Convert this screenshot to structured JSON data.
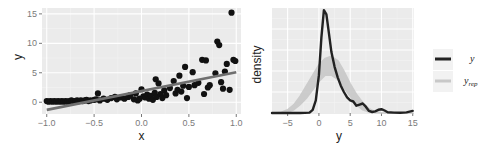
{
  "colors": {
    "panel_bg": "#ebebeb",
    "grid_major": "#ffffff",
    "grid_minor": "#f4f4f4",
    "points": "#111111",
    "fit_line": "#6f6f6f",
    "y_density": "#222222",
    "yrep_band": "#c8c8c8",
    "legend_key_bg": "#f2f2f2"
  },
  "chart_data": [
    {
      "type": "scatter",
      "title": "",
      "xlabel": "x",
      "ylabel": "y",
      "xlim": [
        -1.05,
        1.05
      ],
      "ylim": [
        -2,
        16
      ],
      "xticks": [
        -1.0,
        -0.5,
        0.0,
        0.5,
        1.0
      ],
      "xtick_labels": [
        "-1.0",
        "-0.5",
        "0.0",
        "0.5",
        "1.0"
      ],
      "yticks": [
        0,
        5,
        10,
        15
      ],
      "ytick_labels": [
        "0",
        "5",
        "10",
        "15"
      ],
      "grid": true,
      "points": [
        [
          -1.0,
          0.2
        ],
        [
          -0.98,
          0.1
        ],
        [
          -0.96,
          0.2
        ],
        [
          -0.94,
          0.1
        ],
        [
          -0.92,
          0.2
        ],
        [
          -0.9,
          0.1
        ],
        [
          -0.88,
          0.2
        ],
        [
          -0.86,
          0.1
        ],
        [
          -0.84,
          0.2
        ],
        [
          -0.82,
          0.1
        ],
        [
          -0.8,
          0.2
        ],
        [
          -0.78,
          0.1
        ],
        [
          -0.76,
          0.2
        ],
        [
          -0.74,
          0.3
        ],
        [
          -0.72,
          0.2
        ],
        [
          -0.7,
          0.2
        ],
        [
          -0.68,
          0.3
        ],
        [
          -0.66,
          0.2
        ],
        [
          -0.64,
          0.3
        ],
        [
          -0.62,
          0.2
        ],
        [
          -0.6,
          0.3
        ],
        [
          -0.58,
          0.4
        ],
        [
          -0.56,
          0.2
        ],
        [
          -0.54,
          0.3
        ],
        [
          -0.5,
          0.4
        ],
        [
          -0.48,
          0.5
        ],
        [
          -0.46,
          1.5
        ],
        [
          -0.44,
          0.3
        ],
        [
          -0.4,
          0.6
        ],
        [
          -0.36,
          0.4
        ],
        [
          -0.32,
          0.7
        ],
        [
          -0.28,
          0.9
        ],
        [
          -0.26,
          0.5
        ],
        [
          -0.22,
          0.8
        ],
        [
          -0.18,
          0.6
        ],
        [
          -0.14,
          0.9
        ],
        [
          -0.12,
          1.2
        ],
        [
          -0.08,
          0.5
        ],
        [
          -0.06,
          1.5
        ],
        [
          -0.04,
          0.3
        ],
        [
          -0.02,
          0.6
        ],
        [
          0.0,
          2.2
        ],
        [
          0.02,
          1.0
        ],
        [
          0.04,
          0.8
        ],
        [
          0.06,
          1.3
        ],
        [
          0.08,
          0.6
        ],
        [
          0.1,
          1.1
        ],
        [
          0.12,
          0.4
        ],
        [
          0.14,
          1.6
        ],
        [
          0.15,
          3.9
        ],
        [
          0.16,
          0.9
        ],
        [
          0.18,
          3.2
        ],
        [
          0.2,
          1.4
        ],
        [
          0.22,
          0.7
        ],
        [
          0.24,
          2.0
        ],
        [
          0.26,
          1.2
        ],
        [
          0.3,
          2.4
        ],
        [
          0.34,
          3.6
        ],
        [
          0.36,
          1.5
        ],
        [
          0.38,
          2.1
        ],
        [
          0.4,
          4.5
        ],
        [
          0.42,
          1.8
        ],
        [
          0.44,
          2.8
        ],
        [
          0.46,
          6.0
        ],
        [
          0.48,
          0.7
        ],
        [
          0.5,
          2.6
        ],
        [
          0.54,
          5.1
        ],
        [
          0.56,
          2.9
        ],
        [
          0.6,
          3.3
        ],
        [
          0.64,
          7.2
        ],
        [
          0.66,
          1.4
        ],
        [
          0.68,
          7.1
        ],
        [
          0.7,
          2.5
        ],
        [
          0.72,
          2.9
        ],
        [
          0.78,
          4.9
        ],
        [
          0.8,
          10.3
        ],
        [
          0.82,
          9.7
        ],
        [
          0.84,
          3.4
        ],
        [
          0.86,
          2.3
        ],
        [
          0.88,
          5.2
        ],
        [
          0.9,
          6.5
        ],
        [
          0.93,
          2.1
        ],
        [
          0.95,
          15.2
        ],
        [
          0.97,
          7.2
        ],
        [
          0.99,
          7.0
        ]
      ],
      "fit_line": {
        "x": [
          -1.0,
          1.0
        ],
        "y": [
          -1.3,
          5.1
        ]
      }
    },
    {
      "type": "line",
      "title": "",
      "xlabel": "y",
      "ylabel": "density",
      "xlim": [
        -7.5,
        15.2
      ],
      "ylim": [
        0,
        0.5
      ],
      "xticks": [
        -5,
        0,
        5,
        10,
        15
      ],
      "xtick_labels": [
        "-5",
        "0",
        "5",
        "10",
        "15"
      ],
      "yticks": [],
      "grid": true,
      "legend_position": "right",
      "series": [
        {
          "name": "y",
          "x": [
            -7.5,
            -3,
            -1.5,
            -1,
            -0.5,
            0,
            0.4,
            0.8,
            1.2,
            1.6,
            2,
            2.5,
            3,
            3.5,
            4,
            4.5,
            5,
            5.5,
            6,
            6.5,
            7,
            7.5,
            8,
            8.5,
            9,
            9.5,
            10,
            10.5,
            11,
            12,
            13,
            14,
            15
          ],
          "y": [
            0,
            0,
            0.002,
            0.015,
            0.06,
            0.18,
            0.36,
            0.49,
            0.47,
            0.38,
            0.29,
            0.22,
            0.17,
            0.13,
            0.1,
            0.075,
            0.06,
            0.055,
            0.035,
            0.04,
            0.045,
            0.03,
            0.01,
            0.005,
            0.008,
            0.015,
            0.018,
            0.012,
            0.004,
            0.002,
            0.001,
            0.003,
            0.01
          ]
        },
        {
          "name": "y_rep",
          "x": [
            -7.5,
            -6,
            -5,
            -4,
            -3,
            -2,
            -1,
            0,
            1,
            2,
            3,
            4,
            5,
            6,
            7,
            8,
            9,
            10,
            12,
            15
          ],
          "y_low": [
            0,
            0,
            0.003,
            0.015,
            0.04,
            0.07,
            0.11,
            0.15,
            0.18,
            0.18,
            0.16,
            0.12,
            0.08,
            0.04,
            0.015,
            0.005,
            0.001,
            0,
            0,
            0
          ],
          "y_high": [
            0,
            0.004,
            0.015,
            0.04,
            0.08,
            0.13,
            0.18,
            0.23,
            0.26,
            0.27,
            0.25,
            0.2,
            0.14,
            0.09,
            0.05,
            0.02,
            0.006,
            0.001,
            0,
            0
          ]
        }
      ]
    }
  ],
  "legend": {
    "items": [
      {
        "label": "y",
        "sub": "",
        "color": "#222222",
        "width": 3
      },
      {
        "label": "y",
        "sub": "rep",
        "color": "#c8c8c8",
        "width": 3
      }
    ]
  }
}
